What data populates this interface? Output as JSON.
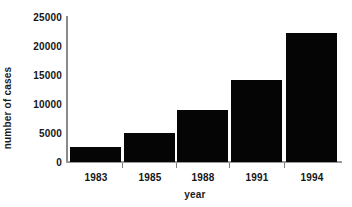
{
  "chart_data": {
    "type": "bar",
    "title": "",
    "xlabel": "year",
    "ylabel": "number of cases",
    "categories": [
      "1983",
      "1985",
      "1988",
      "1991",
      "1994"
    ],
    "values": [
      2600,
      4900,
      8900,
      13900,
      21900
    ],
    "ylim": [
      0,
      25000
    ],
    "yticks": [
      0,
      5000,
      10000,
      15000,
      20000,
      25000
    ],
    "ytick_labels": [
      "0",
      "5000",
      "10000",
      "15000",
      "20000",
      "25000"
    ],
    "grid": false,
    "legend": "none",
    "bar_color": "#050505",
    "axis_color": "#8a8a8a",
    "background_color": "#ffffff",
    "text_color": "#161616"
  }
}
